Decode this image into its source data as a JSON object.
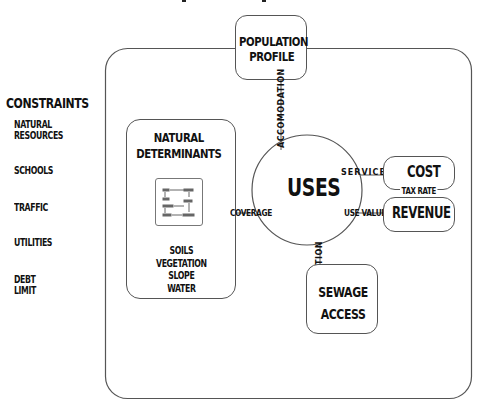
{
  "title_fragment": "",
  "constraints": {
    "heading": "CONSTRAINTS",
    "items": [
      {
        "line1": "NATURAL",
        "line2": "RESOURCES"
      },
      {
        "line1": "SCHOOLS",
        "line2": ""
      },
      {
        "line1": "TRAFFIC",
        "line2": ""
      },
      {
        "line1": "UTILITIES",
        "line2": ""
      },
      {
        "line1": "DEBT",
        "line2": "LIMIT"
      }
    ]
  },
  "nodes": {
    "population": {
      "line1": "POPULATION",
      "line2": "PROFILE"
    },
    "natural": {
      "line1": "NATURAL",
      "line2": "DETERMINANTS",
      "factors": [
        "SOILS",
        "VEGETATION",
        "SLOPE",
        "WATER"
      ]
    },
    "uses": {
      "label": "USES"
    },
    "cost": {
      "label": "COST"
    },
    "revenue": {
      "label": "REVENUE"
    },
    "sewage": {
      "line1": "SEWAGE",
      "line2": "ACCESS"
    }
  },
  "links": {
    "accommodation": "ACCOMODATION",
    "services": "SERVICES",
    "use_value": "USE VALUE",
    "coverage": "COVERAGE",
    "location": "LOCATION",
    "tax_rate": "TAX RATE"
  },
  "colors": {
    "line": "#555555",
    "text": "#111111",
    "background": "#ffffff"
  }
}
